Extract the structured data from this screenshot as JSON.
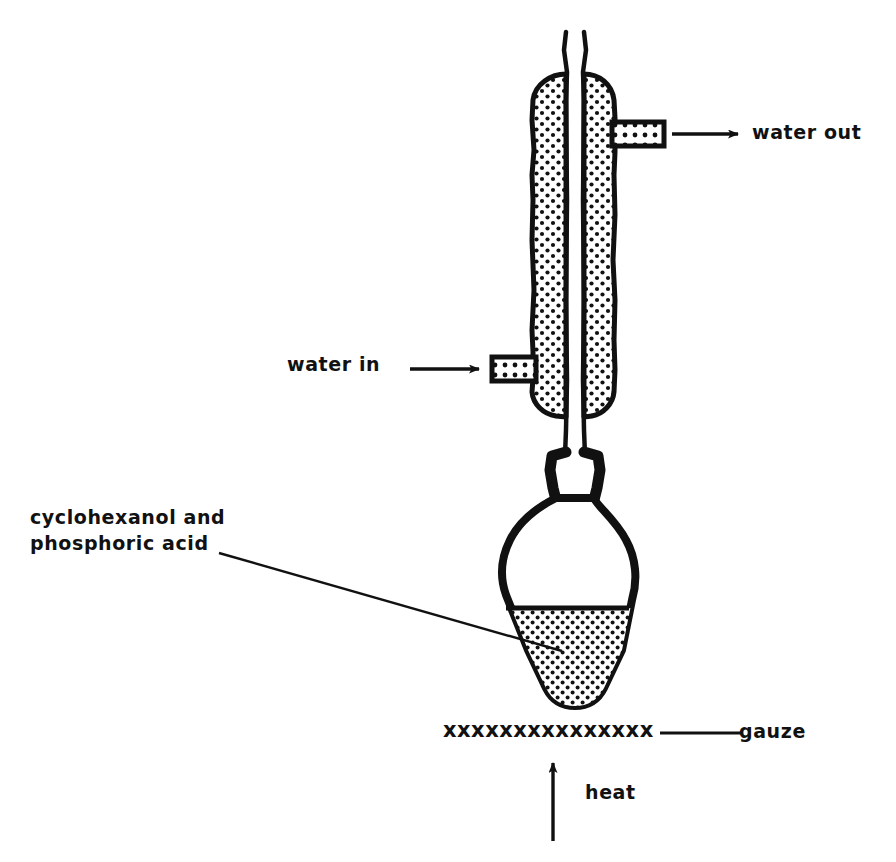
{
  "diagram": {
    "ink_color": "#111111",
    "background_color": "#ffffff",
    "labels": {
      "water_out": "water out",
      "water_in": "water in",
      "reagents_line1": "cyclohexanol and",
      "reagents_line2": "phosphoric acid",
      "gauze": "gauze",
      "heat": "heat",
      "gauze_marks": "xxxxxxxxxxxxxxx"
    },
    "parts": {
      "condenser": "liebig-condenser",
      "condenser_jacket_fill": "stippled-water-jacket",
      "inner_tube": "vapour-tube",
      "water_out_port": "upper-side-arm",
      "water_in_port": "lower-side-arm",
      "joint": "ground-glass-joint",
      "flask": "pear-shaped-flask",
      "flask_contents_fill": "stippled-liquid",
      "gauze": "wire-gauze",
      "heat_source": "bunsen-burner-heat-arrow"
    },
    "arrows": {
      "water_out_direction": "right",
      "water_in_direction": "right",
      "heat_direction": "up"
    }
  }
}
